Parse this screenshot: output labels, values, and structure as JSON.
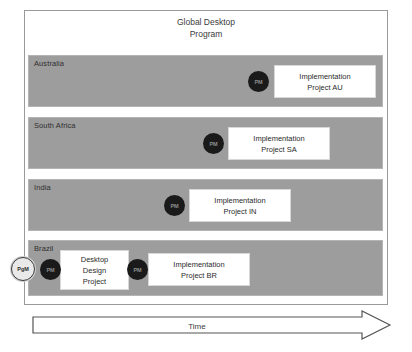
{
  "diagram": {
    "type": "swimlane-program-timeline",
    "program_title": "Global Desktop\nProgram",
    "time_axis_label": "Time",
    "colors": {
      "lane_fill": "#9d9d9d",
      "frame_border": "#9a9a9a",
      "box_fill": "#ffffff",
      "pm_marker_fill": "#1a1a1a",
      "pgm_marker_fill": "#e9e9e9",
      "text": "#2b2b2b"
    }
  },
  "lanes": [
    {
      "label": "Australia",
      "projects": [
        {
          "name": "Implementation\nProject AU",
          "role": "PM"
        }
      ]
    },
    {
      "label": "South Africa",
      "projects": [
        {
          "name": "Implementation\nProject SA",
          "role": "PM"
        }
      ]
    },
    {
      "label": "India",
      "projects": [
        {
          "name": "Implementation\nProject IN",
          "role": "PM"
        }
      ]
    },
    {
      "label": "Brazil",
      "projects": [
        {
          "name": "Desktop\nDesign\nProject",
          "role": "PM"
        },
        {
          "name": "Implementation\nProject BR",
          "role": "PM"
        }
      ],
      "program_manager": {
        "role": "PgM"
      }
    }
  ],
  "roles": {
    "pm": "PM",
    "pgm": "PgM"
  }
}
